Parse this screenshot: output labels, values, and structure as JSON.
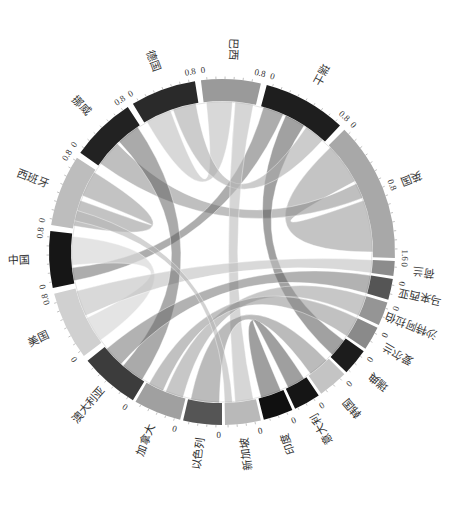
{
  "chart_data": {
    "type": "chord",
    "title": "",
    "center": [
      222,
      252
    ],
    "outer_radius": 173,
    "inner_radius": 151,
    "orientation_note": "Diagram rotated; labels are drawn tangentially/rotated around the ring",
    "segments": [
      {
        "name": "巴西",
        "start": -7,
        "end": 13,
        "color": "#9a9a9a",
        "ticks": [
          "0",
          "0.8"
        ]
      },
      {
        "name": "瑞士",
        "start": 15,
        "end": 43,
        "color": "#1e1e1e",
        "ticks": [
          "0",
          "0.8"
        ]
      },
      {
        "name": "英国",
        "start": 45,
        "end": 92,
        "color": "#a8a8a8",
        "ticks": [
          "0",
          "0.8",
          "1.6"
        ]
      },
      {
        "name": "荷兰",
        "start": 93,
        "end": 98,
        "color": "#8c8c8c",
        "ticks": [
          "0"
        ]
      },
      {
        "name": "马来西亚",
        "start": 99,
        "end": 106,
        "color": "#555555",
        "ticks": [
          "0"
        ]
      },
      {
        "name": "沙特阿拉伯",
        "start": 107,
        "end": 115,
        "color": "#959595",
        "ticks": [
          "0"
        ]
      },
      {
        "name": "爱尔兰",
        "start": 116,
        "end": 124,
        "color": "#8a8a8a",
        "ticks": [
          "0"
        ]
      },
      {
        "name": "瑞典",
        "start": 125,
        "end": 134,
        "color": "#1c1c1c",
        "ticks": [
          "0"
        ]
      },
      {
        "name": "韩国",
        "start": 135,
        "end": 145,
        "color": "#c4c4c4",
        "ticks": [
          "0"
        ]
      },
      {
        "name": "意大利",
        "start": 146,
        "end": 155,
        "color": "#151515",
        "ticks": [
          "0"
        ]
      },
      {
        "name": "印度",
        "start": 156,
        "end": 166,
        "color": "#101010",
        "ticks": [
          "0"
        ]
      },
      {
        "name": "新加坡",
        "start": 167,
        "end": 179,
        "color": "#b9b9b9",
        "ticks": [
          "0"
        ]
      },
      {
        "name": "以色列",
        "start": 180,
        "end": 193,
        "color": "#555555",
        "ticks": [
          "0"
        ]
      },
      {
        "name": "加拿大",
        "start": 194,
        "end": 210,
        "color": "#a0a0a0",
        "ticks": [
          "0"
        ]
      },
      {
        "name": "澳大利亚",
        "start": 211,
        "end": 231,
        "color": "#3c3c3c",
        "ticks": [
          "0"
        ]
      },
      {
        "name": "美国",
        "start": 233,
        "end": 256,
        "color": "#d0d0d0",
        "ticks": [
          "0",
          "0.8"
        ]
      },
      {
        "name": "中国",
        "start": 258,
        "end": 277,
        "color": "#161616",
        "ticks": [
          "0",
          "0.8"
        ]
      },
      {
        "name": "西班牙",
        "start": 279,
        "end": 303,
        "color": "#bdbdbd",
        "ticks": [
          "0",
          "0.8"
        ]
      },
      {
        "name": "挪威",
        "start": 305,
        "end": 327,
        "color": "#222222",
        "ticks": [
          "0",
          "0.8"
        ]
      },
      {
        "name": "德国",
        "start": 329,
        "end": 351,
        "color": "#2a2a2a",
        "ticks": [
          "0",
          "0.8"
        ]
      }
    ],
    "chords": [
      {
        "from": "英国",
        "a": [
          46,
          62
        ],
        "to": "英国",
        "b": [
          70,
          90
        ],
        "color": "#b0b0b0",
        "opacity": 0.75
      },
      {
        "from": "西班牙",
        "a": [
          280,
          290
        ],
        "to": "西班牙",
        "b": [
          292,
          302
        ],
        "color": "#aaaaaa",
        "opacity": 0.7
      },
      {
        "from": "德国",
        "a": [
          330,
          340
        ],
        "to": "巴西",
        "b": [
          -6,
          4
        ],
        "color": "#c8c8c8",
        "opacity": 0.7
      },
      {
        "from": "挪威",
        "a": [
          306,
          316
        ],
        "to": "英国",
        "b": [
          63,
          69
        ],
        "color": "#8a8a8a",
        "opacity": 0.55
      },
      {
        "from": "瑞士",
        "a": [
          16,
          24
        ],
        "to": "中国",
        "b": [
          259,
          264
        ],
        "color": "#6a6a6a",
        "opacity": 0.55
      },
      {
        "from": "瑞士",
        "a": [
          25,
          33
        ],
        "to": "瑞典",
        "b": [
          126,
          133
        ],
        "color": "#444444",
        "opacity": 0.5
      },
      {
        "from": "瑞士",
        "a": [
          34,
          42
        ],
        "to": "德国",
        "b": [
          341,
          350
        ],
        "color": "#aaaaaa",
        "opacity": 0.6
      },
      {
        "from": "巴西",
        "a": [
          5,
          12
        ],
        "to": "新加坡",
        "b": [
          168,
          175
        ],
        "color": "#bbbbbb",
        "opacity": 0.6
      },
      {
        "from": "美国",
        "a": [
          234,
          244
        ],
        "to": "中国",
        "b": [
          265,
          276
        ],
        "color": "#d8d8d8",
        "opacity": 0.7
      },
      {
        "from": "美国",
        "a": [
          245,
          255
        ],
        "to": "荷兰",
        "b": [
          93,
          98
        ],
        "color": "#c0c0c0",
        "opacity": 0.6
      },
      {
        "from": "澳大利亚",
        "a": [
          212,
          221
        ],
        "to": "挪威",
        "b": [
          317,
          326
        ],
        "color": "#555555",
        "opacity": 0.5
      },
      {
        "from": "澳大利亚",
        "a": [
          222,
          230
        ],
        "to": "马来西亚",
        "b": [
          99,
          106
        ],
        "color": "#666666",
        "opacity": 0.5
      },
      {
        "from": "加拿大",
        "a": [
          195,
          202
        ],
        "to": "沙特阿拉伯",
        "b": [
          107,
          115
        ],
        "color": "#999999",
        "opacity": 0.55
      },
      {
        "from": "加拿大",
        "a": [
          203,
          209
        ],
        "to": "爱尔兰",
        "b": [
          116,
          124
        ],
        "color": "#8e8e8e",
        "opacity": 0.55
      },
      {
        "from": "以色列",
        "a": [
          181,
          192
        ],
        "to": "韩国",
        "b": [
          136,
          144
        ],
        "color": "#777777",
        "opacity": 0.5
      },
      {
        "from": "印度",
        "a": [
          157,
          165
        ],
        "to": "意大利",
        "b": [
          147,
          154
        ],
        "color": "#2a2a2a",
        "opacity": 0.45
      },
      {
        "from": "新加坡",
        "a": [
          176,
          179
        ],
        "to": "西班牙",
        "b": [
          282,
          286
        ],
        "color": "#b5b5b5",
        "opacity": 0.6
      }
    ]
  }
}
